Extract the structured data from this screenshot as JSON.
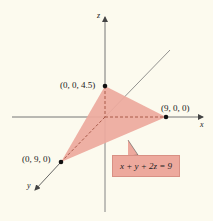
{
  "diagram": {
    "type": "3d-plane-intercepts",
    "axes": {
      "x": {
        "label": "x"
      },
      "y": {
        "label": "y"
      },
      "z": {
        "label": "z"
      }
    },
    "points": [
      {
        "name": "z-intercept",
        "label": "(0, 0, 4.5)"
      },
      {
        "name": "x-intercept",
        "label": "(9, 0, 0)"
      },
      {
        "name": "y-intercept",
        "label": "(0, 9, 0)"
      }
    ],
    "equation": "x + y + 2z = 9",
    "colors": {
      "background": "#fcfaee",
      "plane_fill": "#eda99d",
      "axis": "#555555",
      "point": "#111111"
    }
  }
}
